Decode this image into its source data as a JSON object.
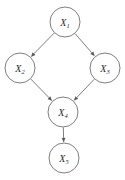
{
  "figure": {
    "kind": "directed-acyclic-graph",
    "background_color": "#ffffff",
    "stroke_color": "#6f6f6f",
    "label_color": "#2b2b2b",
    "arrow_color": "#5a5a5a"
  },
  "nodes": [
    {
      "id": "X1",
      "label_base": "X",
      "label_sub": "1",
      "cx": 65,
      "cy": 22,
      "r": 15
    },
    {
      "id": "X2",
      "label_base": "X",
      "label_sub": "2",
      "cx": 20,
      "cy": 68,
      "r": 15
    },
    {
      "id": "X3",
      "label_base": "X",
      "label_sub": "3",
      "cx": 105,
      "cy": 68,
      "r": 15
    },
    {
      "id": "X4",
      "label_base": "X",
      "label_sub": "4",
      "cx": 63,
      "cy": 112,
      "r": 15
    },
    {
      "id": "X5",
      "label_base": "X",
      "label_sub": "5",
      "cx": 64,
      "cy": 158,
      "r": 15
    }
  ],
  "edges": [
    {
      "id": "X1-X2",
      "from": "X1",
      "to": "X2",
      "directed": true
    },
    {
      "id": "X1-X3",
      "from": "X1",
      "to": "X3",
      "directed": true
    },
    {
      "id": "X2-X4",
      "from": "X2",
      "to": "X4",
      "directed": true
    },
    {
      "id": "X3-X4",
      "from": "X3",
      "to": "X4",
      "directed": true
    },
    {
      "id": "X4-X5",
      "from": "X4",
      "to": "X5",
      "directed": true
    }
  ]
}
